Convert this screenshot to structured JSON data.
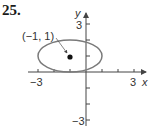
{
  "problem": {
    "number": "25."
  },
  "axes": {
    "x_label": "x",
    "y_label": "y",
    "x_tick_labels": {
      "neg": "−3",
      "pos": "3"
    },
    "y_tick_labels": {
      "pos": "3",
      "neg": "−3"
    },
    "x_range": [
      -3,
      3
    ],
    "y_range": [
      -3,
      3
    ]
  },
  "ellipse": {
    "center": [
      -1,
      1
    ],
    "semi_major_x": 2,
    "semi_minor_y": 1,
    "stroke_color": "#7a7a7a"
  },
  "annotation": {
    "point_label": "(−1, 1)",
    "point": [
      -1,
      1
    ]
  }
}
